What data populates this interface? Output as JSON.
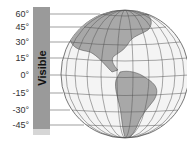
{
  "figure": {
    "bar_label": "Visible",
    "latitudes": [
      {
        "label": "60°",
        "y": 14
      },
      {
        "label": "45°",
        "y": 27
      },
      {
        "label": "30°",
        "y": 42
      },
      {
        "label": "15°",
        "y": 58
      },
      {
        "label": "0°",
        "y": 75
      },
      {
        "label": "-15°",
        "y": 93
      },
      {
        "label": "-30°",
        "y": 110
      },
      {
        "label": "-45°",
        "y": 125
      }
    ],
    "colors": {
      "bar": "#9a9a9a",
      "land": "#a8a8a8",
      "ocean": "#f4f4f4",
      "grid": "#555555"
    }
  }
}
